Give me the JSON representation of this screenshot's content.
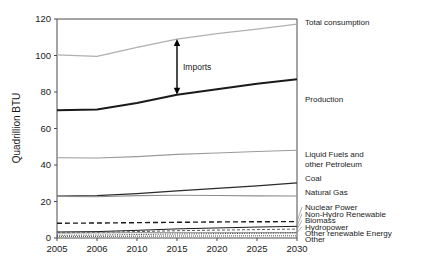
{
  "chart_data": {
    "type": "line",
    "title": "",
    "xlabel": "",
    "ylabel": "Quadrillion BTU",
    "x": [
      "2005",
      "2006",
      "2010",
      "2015",
      "2020",
      "2025",
      "2030"
    ],
    "categories": [
      "2005",
      "2006",
      "2010",
      "2015",
      "2020",
      "2025",
      "2030"
    ],
    "ylim": [
      0,
      120
    ],
    "yticks": [
      0,
      20,
      40,
      60,
      80,
      100,
      120
    ],
    "ytick_labels": [
      "0",
      "20",
      "40",
      "60",
      "80",
      "100",
      "120"
    ],
    "grid": false,
    "legend_position": "right-inline-labels",
    "series": [
      {
        "name": "Total consumption",
        "label": "Total consumption",
        "values": [
          100.3,
          99.5,
          104.5,
          109.0,
          112.0,
          114.5,
          117.2
        ],
        "color": "#b0b0b0",
        "width": 1.3,
        "dash": "none",
        "label_y": 118.5
      },
      {
        "name": "Production",
        "label": "Production",
        "values": [
          70.0,
          70.4,
          74.0,
          78.5,
          81.5,
          84.5,
          87.0
        ],
        "color": "#1a1a1a",
        "width": 1.9,
        "dash": "none",
        "label_y": 76.0
      },
      {
        "name": "Liquid Fuels and other Petroleum",
        "label": "Liquid Fuels and\nother Petroleum",
        "values": [
          44.0,
          43.8,
          44.6,
          45.8,
          46.6,
          47.4,
          48.1
        ],
        "color": "#9a9a9a",
        "width": 1.1,
        "dash": "none",
        "label_y": 46.0
      },
      {
        "name": "Coal",
        "label": "Coal",
        "values": [
          23.0,
          23.2,
          24.3,
          25.8,
          27.2,
          28.6,
          30.2
        ],
        "color": "#2a2a2a",
        "width": 1.2,
        "dash": "none",
        "label_y": 33.0
      },
      {
        "name": "Natural Gas",
        "label": "Natural Gas",
        "values": [
          22.8,
          22.6,
          23.2,
          23.4,
          23.3,
          23.1,
          23.0
        ],
        "color": "#8e8e8e",
        "width": 1.1,
        "dash": "none",
        "label_y": 25.0
      },
      {
        "name": "Nuclear Power",
        "label": "Nuclear Power",
        "values": [
          8.1,
          8.2,
          8.4,
          8.6,
          8.8,
          8.9,
          9.0
        ],
        "color": "#1a1a1a",
        "width": 1.4,
        "dash": "5,3",
        "label_y": 17.0
      },
      {
        "name": "Non-Hydro Renewable",
        "label": "Non-Hydro Renewable",
        "values": [
          3.3,
          3.5,
          4.2,
          5.0,
          5.5,
          6.0,
          6.4
        ],
        "color": "#1a1a1a",
        "width": 1.0,
        "dash": "none",
        "label_y": 13.3
      },
      {
        "name": "Biomass",
        "label": "Biomass",
        "values": [
          3.0,
          3.1,
          3.5,
          4.0,
          4.3,
          4.6,
          4.9
        ],
        "color": "#5a5a5a",
        "width": 1.0,
        "dash": "3,2",
        "label_y": 9.6
      },
      {
        "name": "Hydropower",
        "label": "Hydropower",
        "values": [
          2.7,
          2.8,
          2.9,
          2.9,
          2.9,
          2.9,
          2.9
        ],
        "color": "#7a7a7a",
        "width": 0.9,
        "dash": "none",
        "label_y": 6.2
      },
      {
        "name": "Other renewable Energy",
        "label": "Other renewable Energy",
        "values": [
          1.5,
          1.6,
          1.9,
          2.2,
          2.4,
          2.6,
          2.8
        ],
        "color": "#1a1a1a",
        "width": 0.9,
        "dash": "1,1.4",
        "label_y": 2.8
      },
      {
        "name": "Other",
        "label": "Other",
        "values": [
          0.9,
          0.9,
          1.0,
          1.1,
          1.1,
          1.2,
          1.2
        ],
        "color": "#3a3a3a",
        "width": 0.9,
        "dash": "1,1",
        "label_y": -0.8
      }
    ],
    "annotations": [
      {
        "name": "imports-arrow",
        "label": "Imports",
        "x_index": 3,
        "y_top": 109.0,
        "y_bottom": 78.5
      }
    ]
  }
}
